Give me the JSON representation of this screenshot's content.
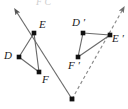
{
  "figure": {
    "clipped_top_text": "F C",
    "colors": {
      "stroke": "#6b6b6b",
      "point": "#111111",
      "label": "#1a1a1a",
      "dashed": "#8a8a8a",
      "background": "#ffffff",
      "faint": "#cfcfcf"
    },
    "canvas": {
      "width": 128,
      "height": 109
    }
  },
  "points": [
    {
      "id": "E",
      "label": "E",
      "x": 34,
      "y": 33,
      "label_x": 39,
      "label_y": 19
    },
    {
      "id": "D",
      "label": "D",
      "x": 19,
      "y": 57,
      "label_x": 4,
      "label_y": 50
    },
    {
      "id": "F",
      "label": "F",
      "x": 39,
      "y": 72,
      "label_x": 42,
      "label_y": 74
    },
    {
      "id": "Dp",
      "label": "D ′",
      "x": 83,
      "y": 33,
      "label_x": 72,
      "label_y": 17
    },
    {
      "id": "Ep",
      "label": "E ′",
      "x": 110,
      "y": 35,
      "label_x": 112,
      "label_y": 33
    },
    {
      "id": "Fp",
      "label": "F ′",
      "x": 78,
      "y": 57,
      "label_x": 68,
      "label_y": 60
    },
    {
      "id": "C",
      "label": "",
      "x": 72,
      "y": 99,
      "label_x": 0,
      "label_y": 0
    }
  ],
  "triangles": [
    {
      "name": "triangle-def",
      "vertices": [
        "D",
        "E",
        "F"
      ],
      "style": "solid"
    },
    {
      "name": "triangle-dpepfp",
      "vertices": [
        "Dp",
        "Ep",
        "Fp"
      ],
      "style": "solid"
    }
  ],
  "rays": [
    {
      "name": "ray-through-e",
      "from": "C",
      "through": "E",
      "tip_x": 16,
      "tip_y": 11,
      "style": "solid"
    },
    {
      "name": "ray-through-ep",
      "from": "C",
      "through": "Ep",
      "tip_x": 123,
      "tip_y": 9,
      "style": "dashed"
    }
  ]
}
